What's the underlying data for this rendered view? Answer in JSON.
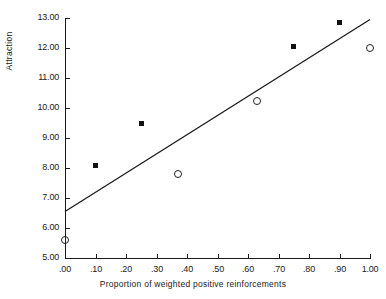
{
  "chart_data": {
    "type": "scatter",
    "title": "",
    "xlabel": "Proportion of weighted positive reinforcements",
    "ylabel": "Attraction",
    "xlim": [
      0.0,
      1.0
    ],
    "ylim": [
      5.0,
      13.0
    ],
    "grid": false,
    "legend": "none",
    "xticks": [
      ".00",
      ".10",
      ".20",
      ".30",
      ".40",
      ".50",
      ".60",
      ".70",
      ".80",
      ".90",
      "1.00"
    ],
    "xtick_values": [
      0.0,
      0.1,
      0.2,
      0.3,
      0.4,
      0.5,
      0.6,
      0.7,
      0.8,
      0.9,
      1.0
    ],
    "yticks": [
      "13.00",
      "12.00",
      "11.00",
      "10.00",
      "9.00",
      "8.00",
      "7.00",
      "6.00",
      "5.00"
    ],
    "ytick_values": [
      13.0,
      12.0,
      11.0,
      10.0,
      9.0,
      8.0,
      7.0,
      6.0,
      5.0
    ],
    "series": [
      {
        "name": "filled-squares",
        "marker": "filled-square",
        "color": "#111111",
        "x": [
          0.1,
          0.25,
          0.75,
          0.9
        ],
        "y": [
          8.1,
          9.48,
          12.05,
          12.85
        ]
      },
      {
        "name": "open-circles",
        "marker": "open-circle",
        "color": "#222222",
        "x": [
          0.0,
          0.37,
          0.63,
          1.0
        ],
        "y": [
          5.6,
          7.8,
          10.25,
          12.0
        ]
      }
    ],
    "fit_line": {
      "name": "regression-line",
      "color": "#1a1a1a",
      "x": [
        0.0,
        1.0
      ],
      "y": [
        6.55,
        12.95
      ]
    }
  }
}
